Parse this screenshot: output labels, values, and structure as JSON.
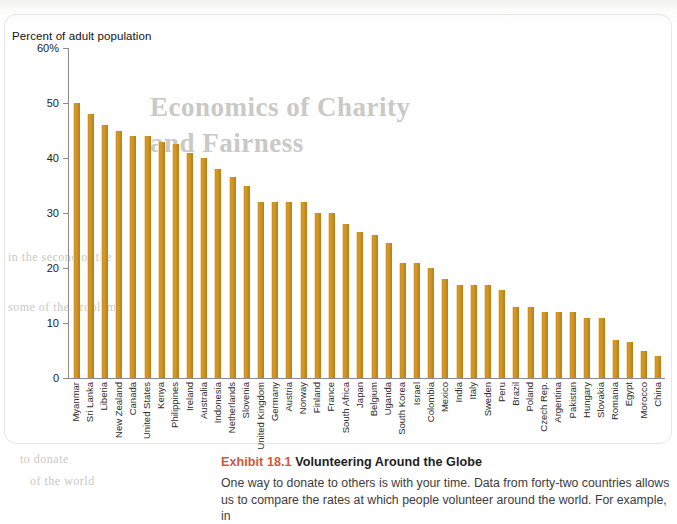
{
  "figure": {
    "y_axis_title": "Percent of adult population",
    "y_ticks": [
      "60%",
      "50",
      "40",
      "30",
      "20",
      "10",
      "0"
    ]
  },
  "caption": {
    "exhibit_label": "Exhibit 18.1",
    "title": "Volunteering Around the Globe",
    "body_line_1": "One way to donate to others is with your time. Data from forty-two countries allows",
    "body_line_2": "us to compare the rates at which people volunteer around the world. For example, in"
  },
  "bleed_through": {
    "line_1": "Economics of Charity",
    "line_2": "and Fairness",
    "line_3": "in the second of the",
    "line_4": "some of the problem",
    "line_5": "to donate",
    "line_6": "of the world"
  },
  "colors": {
    "bar_fill": "#c98f22",
    "bar_highlight": "#f4dfae",
    "axis": "#8a8a8a",
    "exhibit_accent": "#d2573c",
    "caption_text": "#3c3c3c"
  },
  "chart_data": {
    "type": "bar",
    "title": "Volunteering Around the Globe",
    "xlabel": "",
    "ylabel": "Percent of adult population",
    "ylim": [
      0,
      60
    ],
    "yticks": [
      0,
      10,
      20,
      30,
      40,
      50,
      60
    ],
    "grid": false,
    "legend": "none",
    "orientation": "vertical",
    "categories": [
      "Myanmar",
      "Sri Lanka",
      "Liberia",
      "New Zealand",
      "Canada",
      "United States",
      "Kenya",
      "Philippines",
      "Ireland",
      "Australia",
      "Indonesia",
      "Netherlands",
      "Slovenia",
      "United Kingdom",
      "Germany",
      "Austria",
      "Norway",
      "Finland",
      "France",
      "South Africa",
      "Japan",
      "Belgium",
      "Uganda",
      "South Korea",
      "Israel",
      "Colombia",
      "Mexico",
      "India",
      "Italy",
      "Sweden",
      "Peru",
      "Brazil",
      "Poland",
      "Czech Rep.",
      "Argentina",
      "Pakistan",
      "Hungary",
      "Slovakia",
      "Romania",
      "Egypt",
      "Morocco",
      "China"
    ],
    "values": [
      50.0,
      48.0,
      46.0,
      45.0,
      44.0,
      44.0,
      43.0,
      42.5,
      41.0,
      40.0,
      38.0,
      36.5,
      35.0,
      32.0,
      32.0,
      32.0,
      32.0,
      30.0,
      30.0,
      28.0,
      26.5,
      26.0,
      24.5,
      21.0,
      21.0,
      20.0,
      18.0,
      17.0,
      17.0,
      17.0,
      16.0,
      13.0,
      13.0,
      12.0,
      12.0,
      12.0,
      11.0,
      11.0,
      7.0,
      6.5,
      5.0,
      4.0
    ]
  }
}
